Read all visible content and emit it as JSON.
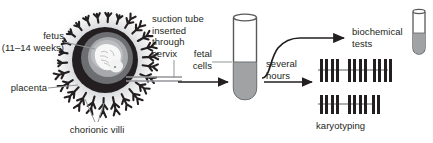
{
  "figure": {
    "background": "#ffffff",
    "ink": "#231f20"
  },
  "palette": {
    "outer_ring": "#231f20",
    "uterine_wall": "#58595b",
    "amnion_gray": "#929497",
    "inner_gray": "#a7a9ac",
    "fetus_white": "#f7f7f7",
    "halo_gray": "#d9d9d9",
    "fluid_gray": "#a0a2a4",
    "tube_outline": "#58595b",
    "leader_line": "#939598",
    "chromosome": "#231f20",
    "spindle_axis": "#939598"
  },
  "labels": {
    "fetus": "fetus",
    "fetus_age": "(11–14 weeks)",
    "placenta": "placenta",
    "chorionic_villi": "chorionic villi",
    "suction_tube": "suction tube\ninserted\nthrough\ncervix",
    "fetal_cells": "fetal\ncells",
    "several_hours": "several\nhours",
    "biochemical_tests": "biochemical\ntests",
    "karyotyping": "karyotyping"
  },
  "diagram_elements": {
    "uterus": {
      "name": "uterus-with-fetus",
      "center_x": 105,
      "center_y": 60,
      "villi_count": 26
    },
    "sample_tube": {
      "name": "fetal-cell-collection-tube",
      "x": 232,
      "y": 15,
      "width": 26,
      "height": 86,
      "fill_level_percent": 58
    },
    "result_tube": {
      "name": "biochemical-test-tube",
      "x": 412,
      "y": 10,
      "width": 13,
      "height": 48,
      "fill_level_percent": 50
    },
    "karyotype_rows": [
      {
        "groups": [
          2,
          2,
          2
        ]
      },
      {
        "groups": [
          2,
          2,
          1
        ]
      }
    ]
  }
}
